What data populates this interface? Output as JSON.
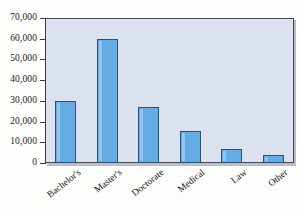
{
  "chart_data": {
    "type": "bar",
    "title": "",
    "xlabel": "",
    "ylabel": "",
    "categories": [
      "Bachelor's",
      "Master's",
      "Doctorate",
      "Medical",
      "Law",
      "Other"
    ],
    "values": [
      30000,
      60000,
      27000,
      15500,
      6800,
      4000
    ],
    "ylim": [
      0,
      70000
    ],
    "ytick_values": [
      0,
      10000,
      20000,
      30000,
      40000,
      50000,
      60000,
      70000
    ],
    "ytick_labels": [
      "0",
      "10,000",
      "20,000",
      "30,000",
      "40,000",
      "50,000",
      "60,000",
      "70,000"
    ],
    "grid": false,
    "legend": null,
    "series": [
      {
        "name": "Degrees",
        "values": [
          30000,
          60000,
          27000,
          15500,
          6800,
          4000
        ]
      }
    ],
    "colors": {
      "bar_fill": "#66ace4",
      "bar_border": "#30506e",
      "plot_background": "#dce1f0",
      "frame_border": "#4a4a55",
      "text": "#141414",
      "page_background": "#fdfdfc"
    }
  }
}
